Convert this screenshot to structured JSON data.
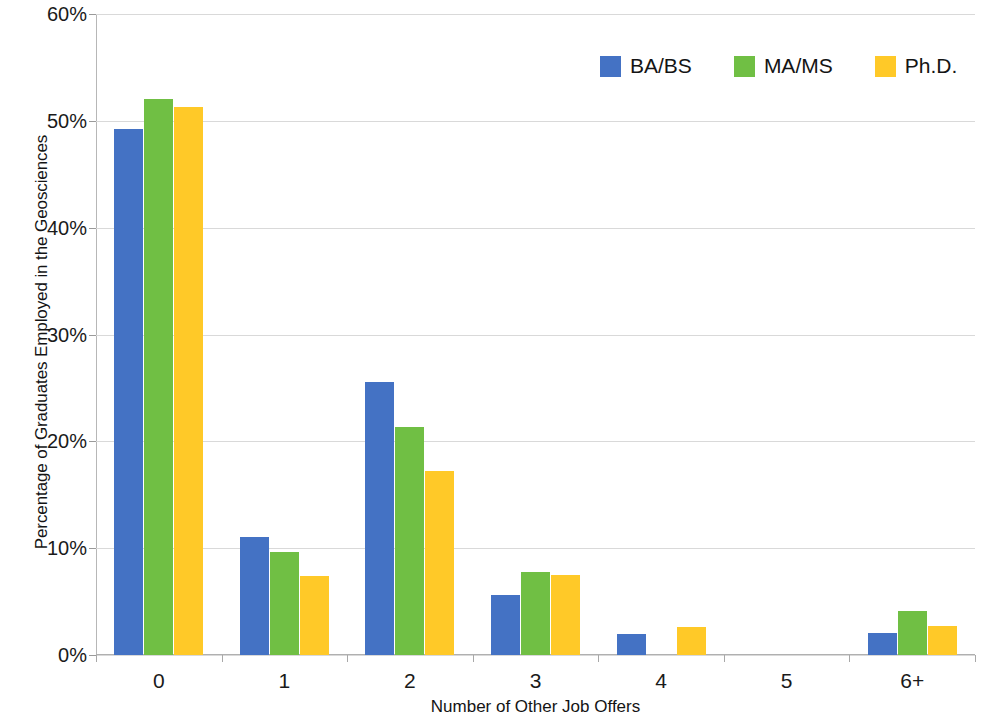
{
  "chart_data": {
    "type": "bar",
    "title": "",
    "xlabel": "Number of Other Job Offers",
    "ylabel": "Percentage of Graduates Employed in the Geosciences",
    "categories": [
      "0",
      "1",
      "2",
      "3",
      "4",
      "5",
      "6+"
    ],
    "ylim": [
      0,
      60
    ],
    "ytick_values": [
      0,
      10,
      20,
      30,
      40,
      50,
      60
    ],
    "ytick_labels": [
      "0%",
      "10%",
      "20%",
      "30%",
      "40%",
      "50%",
      "60%"
    ],
    "grid": true,
    "legend_position": "top-right",
    "series": [
      {
        "name": "BA/BS",
        "color": "#4472C4",
        "values": [
          49.2,
          11.0,
          25.6,
          5.6,
          2.0,
          0,
          2.1
        ]
      },
      {
        "name": "MA/MS",
        "color": "#70BF44",
        "values": [
          52.0,
          9.6,
          21.3,
          7.8,
          0,
          0,
          4.1
        ]
      },
      {
        "name": "Ph.D.",
        "color": "#FFC928",
        "values": [
          51.3,
          7.4,
          17.2,
          7.5,
          2.6,
          0,
          2.7
        ]
      }
    ]
  }
}
